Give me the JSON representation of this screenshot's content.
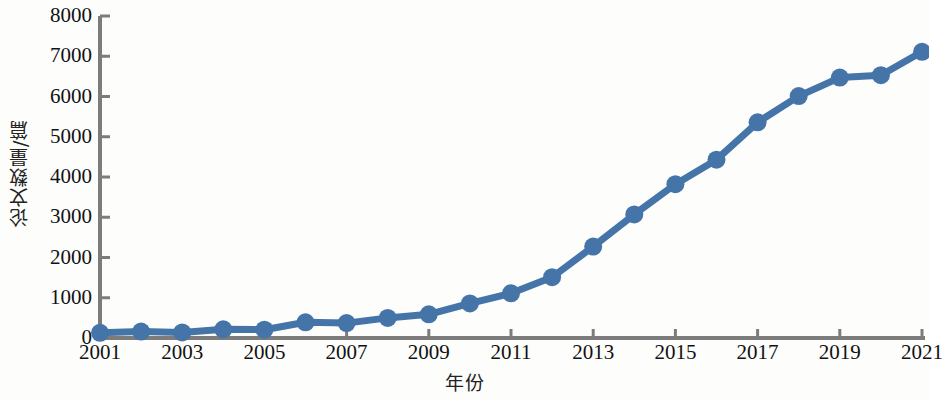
{
  "chart_data": {
    "type": "line",
    "title": "",
    "xlabel": "年份",
    "ylabel": "论文数量/篇",
    "x": [
      2001,
      2002,
      2003,
      2004,
      2005,
      2006,
      2007,
      2008,
      2009,
      2010,
      2011,
      2012,
      2013,
      2014,
      2015,
      2016,
      2017,
      2018,
      2019,
      2020,
      2021
    ],
    "values": [
      130,
      160,
      140,
      215,
      205,
      390,
      370,
      500,
      590,
      860,
      1110,
      1510,
      2270,
      3070,
      3820,
      4430,
      5360,
      6010,
      6470,
      6530,
      7110
    ],
    "series": [
      {
        "name": "论文数量",
        "values": [
          130,
          160,
          140,
          215,
          205,
          390,
          370,
          500,
          590,
          860,
          1110,
          1510,
          2270,
          3070,
          3820,
          4430,
          5360,
          6010,
          6470,
          6530,
          7110
        ]
      }
    ],
    "x_tick_labels": [
      "2001",
      "2003",
      "2005",
      "2007",
      "2009",
      "2011",
      "2013",
      "2015",
      "2017",
      "2019",
      "2021"
    ],
    "x_tick_values": [
      2001,
      2003,
      2005,
      2007,
      2009,
      2011,
      2013,
      2015,
      2017,
      2019,
      2021
    ],
    "y_tick_labels": [
      "0",
      "1000",
      "2000",
      "3000",
      "4000",
      "5000",
      "6000",
      "7000",
      "8000"
    ],
    "y_tick_values": [
      0,
      1000,
      2000,
      3000,
      4000,
      5000,
      6000,
      7000,
      8000
    ],
    "xlim": [
      2001,
      2021
    ],
    "ylim": [
      0,
      8000
    ],
    "grid": false,
    "legend": false,
    "legend_position": "none",
    "marker": "circle",
    "colors": {
      "line": "#4575a8",
      "marker": "#4575a8",
      "axis": "#7c7c7c",
      "text": "#111111",
      "background": "#fdfdfc"
    }
  }
}
